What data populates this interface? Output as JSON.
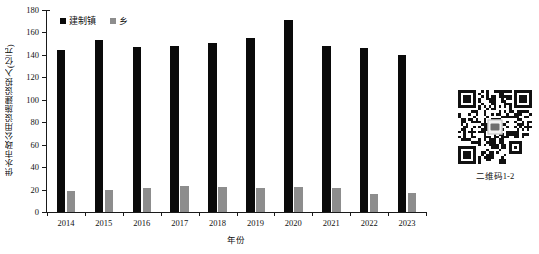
{
  "chart_data": {
    "type": "bar",
    "title": "",
    "xlabel": "年份",
    "ylabel": "供水市政公用设施建设投入(亿元)",
    "categories": [
      "2014",
      "2015",
      "2016",
      "2017",
      "2018",
      "2019",
      "2020",
      "2021",
      "2022",
      "2023"
    ],
    "series": [
      {
        "name": "建制镇",
        "color": "#0a0a0a",
        "values": [
          144,
          153,
          147,
          148,
          151,
          155,
          171,
          148,
          146,
          140
        ]
      },
      {
        "name": "乡",
        "color": "#8d8d8d",
        "values": [
          19,
          20,
          21,
          23,
          22,
          21,
          22,
          21,
          16,
          17
        ]
      }
    ],
    "ylim": [
      0,
      180
    ],
    "ytick_labels": [
      "0",
      "20",
      "40",
      "60",
      "80",
      "100",
      "120",
      "140",
      "160",
      "180"
    ],
    "ytick_values": [
      0,
      20,
      40,
      60,
      80,
      100,
      120,
      140,
      160,
      180
    ],
    "grid": false,
    "legend_position": "top-left"
  },
  "qr": {
    "caption": "二维码1-2",
    "logo_icon": "wechat-logo-icon"
  }
}
